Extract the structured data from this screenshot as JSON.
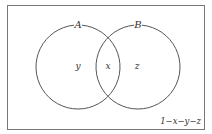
{
  "diagram": {
    "type": "venn",
    "sets": [
      {
        "name": "A",
        "region_label": "y"
      },
      {
        "name": "B",
        "region_label": "z"
      }
    ],
    "intersection_label": "x",
    "outside_label": "1−x−y−z",
    "colors": {
      "stroke": "#555555",
      "background": "#ffffff",
      "text": "#333333"
    }
  }
}
